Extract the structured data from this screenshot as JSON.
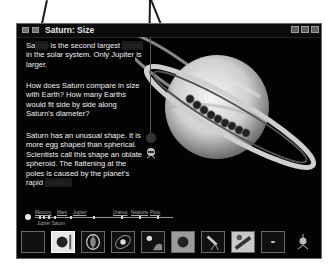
{
  "window": {
    "title": "Saturn: Size",
    "controls": [
      "minimize",
      "maximize",
      "close"
    ]
  },
  "content": {
    "paragraph1": {
      "before": "Sa",
      "hidden1": "turn",
      "after1": " is the second largest ",
      "hidden2": "planet",
      "after2": " in the solar system. Only Jupiter is larger."
    },
    "paragraph2": "How does Saturn compare in size with Earth? How many Earths would fit side by side along Saturn's diameter?",
    "paragraph3": {
      "text": "Saturn has an unusual shape. It is more egg shaped than spherical. Scientists call this shape an oblate spheroid. The flattening at the poles is caused by the planet's rapid ",
      "hidden": "rotation."
    }
  },
  "timeline": {
    "sun_label": "Sun",
    "planets": [
      "Mercury",
      "Venus",
      "Earth",
      "Mars",
      "Jupiter",
      "Saturn",
      "Uranus",
      "Neptune",
      "Pluto"
    ],
    "sub_label": "Jupiter  Saturn"
  },
  "toolbar": {
    "buttons": [
      {
        "name": "blank",
        "icon": "empty-frame-icon"
      },
      {
        "name": "saturn-size",
        "icon": "saturn-size-icon",
        "selected": true
      },
      {
        "name": "saturn-interior",
        "icon": "planet-interior-icon"
      },
      {
        "name": "saturn-orbit",
        "icon": "orbit-icon"
      },
      {
        "name": "moons",
        "icon": "moon-icon"
      },
      {
        "name": "saturn-photo",
        "icon": "planet-photo-icon"
      },
      {
        "name": "telescope",
        "icon": "telescope-icon"
      },
      {
        "name": "spacecraft",
        "icon": "spacecraft-icon"
      },
      {
        "name": "stars",
        "icon": "star-icon"
      },
      {
        "name": "guide",
        "icon": "alien-guide-icon"
      }
    ]
  },
  "colors": {
    "background": "#030303",
    "text": "#f0f0f0",
    "frame": "#6a6a6a"
  }
}
